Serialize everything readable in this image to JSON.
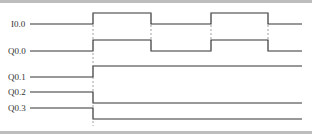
{
  "diagram": {
    "type": "timing-diagram",
    "signals": [
      {
        "name": "I0.0",
        "y": 24,
        "high_y": 13,
        "transitions": [
          {
            "x": 93,
            "to": "high"
          },
          {
            "x": 151,
            "to": "low"
          },
          {
            "x": 211,
            "to": "high"
          },
          {
            "x": 268,
            "to": "low"
          }
        ]
      },
      {
        "name": "Q0.0",
        "y": 51,
        "high_y": 40,
        "transitions": [
          {
            "x": 93,
            "to": "high"
          },
          {
            "x": 151,
            "to": "low"
          },
          {
            "x": 211,
            "to": "high"
          },
          {
            "x": 268,
            "to": "low"
          }
        ]
      },
      {
        "name": "Q0.1",
        "y": 77,
        "high_y": 66,
        "transitions": [
          {
            "x": 93,
            "to": "high"
          }
        ]
      },
      {
        "name": "Q0.2",
        "y": 92,
        "low_y": 103,
        "transitions": [
          {
            "x": 93,
            "to": "low"
          }
        ]
      },
      {
        "name": "Q0.3",
        "y": 108,
        "low_y": 119,
        "transitions": [
          {
            "x": 93,
            "to": "low"
          }
        ]
      }
    ],
    "x_start": 30,
    "x_end": 302,
    "trigger_x": 93
  }
}
